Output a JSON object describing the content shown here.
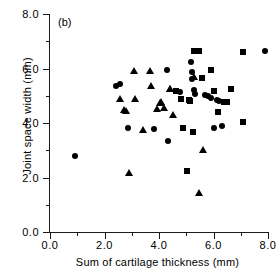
{
  "panel": {
    "label": "(b)"
  },
  "chart_data": {
    "type": "scatter",
    "title": "",
    "xlabel": "Sum of cartilage thickness (mm)",
    "ylabel": "Joint space width (mm)",
    "xlim": [
      0.0,
      8.0
    ],
    "ylim": [
      0.0,
      8.0
    ],
    "grid": false,
    "legend": "none",
    "xticks": [
      "0.0",
      "2.0",
      "4.0",
      "6.0",
      "8.0"
    ],
    "xtick_values": [
      0.0,
      2.0,
      4.0,
      6.0,
      8.0
    ],
    "xminor_values": [
      1.0,
      3.0,
      5.0,
      7.0
    ],
    "yticks": [
      "0.0",
      "2.0",
      "4.0",
      "6.0",
      "8.0"
    ],
    "ytick_values": [
      0.0,
      2.0,
      4.0,
      6.0,
      8.0
    ],
    "yminor_values": [
      1.0,
      3.0,
      5.0,
      7.0
    ],
    "series": [
      {
        "name": "circle",
        "marker": "circle",
        "points": [
          [
            0.9,
            2.78
          ],
          [
            2.42,
            5.35
          ],
          [
            2.56,
            5.42
          ],
          [
            2.88,
            3.8
          ],
          [
            3.82,
            3.78
          ],
          [
            4.3,
            5.96
          ],
          [
            4.32,
            3.35
          ],
          [
            4.62,
            5.16
          ],
          [
            4.76,
            5.12
          ],
          [
            5.18,
            6.24
          ],
          [
            5.2,
            5.88
          ],
          [
            5.22,
            5.62
          ],
          [
            5.3,
            5.22
          ],
          [
            5.32,
            5.08
          ],
          [
            5.68,
            5.02
          ],
          [
            5.8,
            5.0
          ],
          [
            5.92,
            4.92
          ],
          [
            6.0,
            3.8
          ],
          [
            6.12,
            4.86
          ],
          [
            6.22,
            4.82
          ],
          [
            6.3,
            3.88
          ],
          [
            7.9,
            6.66
          ]
        ]
      },
      {
        "name": "triangle",
        "marker": "triangle",
        "points": [
          [
            2.58,
            4.92
          ],
          [
            2.72,
            4.52
          ],
          [
            2.8,
            4.48
          ],
          [
            2.9,
            2.22
          ],
          [
            3.08,
            5.94
          ],
          [
            3.12,
            4.92
          ],
          [
            3.4,
            3.78
          ],
          [
            3.68,
            5.94
          ],
          [
            3.72,
            5.38
          ],
          [
            3.92,
            4.54
          ],
          [
            4.02,
            4.78
          ],
          [
            4.08,
            4.8
          ],
          [
            4.18,
            4.58
          ],
          [
            4.4,
            5.28
          ],
          [
            4.42,
            5.3
          ],
          [
            4.52,
            4.34
          ],
          [
            5.3,
            5.74
          ],
          [
            5.48,
            1.48
          ],
          [
            5.62,
            3.04
          ]
        ]
      },
      {
        "name": "square",
        "marker": "square",
        "points": [
          [
            4.62,
            5.18
          ],
          [
            4.8,
            4.88
          ],
          [
            4.88,
            3.8
          ],
          [
            5.02,
            2.24
          ],
          [
            5.1,
            4.86
          ],
          [
            5.12,
            4.82
          ],
          [
            5.24,
            3.66
          ],
          [
            5.3,
            6.66
          ],
          [
            5.46,
            6.66
          ],
          [
            5.56,
            5.66
          ],
          [
            5.9,
            5.96
          ],
          [
            6.02,
            5.18
          ],
          [
            6.18,
            4.42
          ],
          [
            6.38,
            4.78
          ],
          [
            6.5,
            4.78
          ],
          [
            6.66,
            5.24
          ],
          [
            7.08,
            4.04
          ],
          [
            7.1,
            6.62
          ]
        ]
      }
    ]
  }
}
